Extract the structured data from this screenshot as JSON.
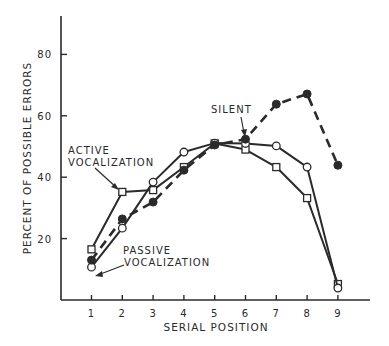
{
  "chart_data": {
    "type": "line",
    "title": "",
    "xlabel": "SERIAL POSITION",
    "ylabel": "PERCENT OF POSSIBLE ERRORS",
    "x": [
      1,
      2,
      3,
      4,
      5,
      6,
      7,
      8,
      9
    ],
    "x_tick_labels": [
      "1",
      "2",
      "3",
      "4",
      "5",
      "6",
      "7",
      "8",
      "9"
    ],
    "y_ticks": [
      20,
      40,
      60,
      80
    ],
    "y_tick_labels": [
      "20",
      "40",
      "60",
      "80"
    ],
    "xlim": [
      0,
      10
    ],
    "ylim": [
      0,
      93
    ],
    "grid": false,
    "legend": "inline annotations with arrows",
    "series": [
      {
        "name": "ACTIVE VOCALIZATION",
        "marker": "open-square",
        "line": "solid",
        "values": [
          16.5,
          35.2,
          35.8,
          43.3,
          51.0,
          49.0,
          43.3,
          33.2,
          5.2
        ]
      },
      {
        "name": "PASSIVE VOCALIZATION",
        "marker": "open-circle",
        "line": "solid",
        "values": [
          10.7,
          23.4,
          38.4,
          48.2,
          51.1,
          51.0,
          50.2,
          43.3,
          3.9
        ]
      },
      {
        "name": "SILENT",
        "marker": "filled-circle",
        "line": "dashed",
        "values": [
          13.0,
          26.4,
          31.9,
          42.3,
          50.5,
          52.4,
          63.8,
          67.1,
          43.9
        ]
      }
    ],
    "annotations": [
      {
        "text_lines": [
          "ACTIVE",
          "VOCALIZATION"
        ],
        "points_to": {
          "series": "ACTIVE VOCALIZATION",
          "x": 2
        }
      },
      {
        "text_lines": [
          "PASSIVE",
          "VOCALIZATION"
        ],
        "points_to": {
          "series": "PASSIVE VOCALIZATION",
          "x": 1
        }
      },
      {
        "text_lines": [
          "SILENT"
        ],
        "points_to": {
          "series": "SILENT",
          "x": 6
        }
      }
    ]
  },
  "labels": {
    "active_line1": "ACTIVE",
    "active_line2": "VOCALIZATION",
    "passive_line1": "PASSIVE",
    "passive_line2": "VOCALIZATION",
    "silent": "SILENT"
  },
  "style": {
    "ink": "#2a2a2a",
    "background": "#ffffff"
  }
}
